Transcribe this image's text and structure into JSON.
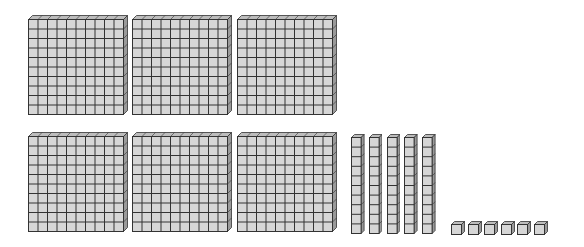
{
  "diagram": {
    "represented_value": 656,
    "colors": {
      "face": "#d6d6d6",
      "top": "#bdbdbd",
      "side": "#9a9a9a",
      "line": "#333333"
    },
    "flats": {
      "count": 6,
      "value_each": 100,
      "rows": [
        3,
        3
      ]
    },
    "rods": {
      "count": 5,
      "value_each": 10
    },
    "units": {
      "count": 6,
      "value_each": 1
    }
  }
}
